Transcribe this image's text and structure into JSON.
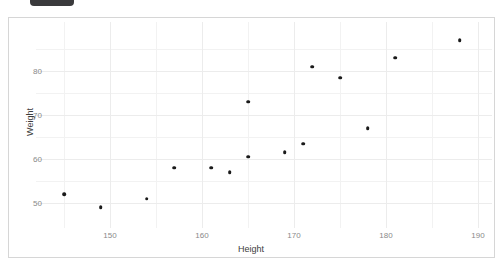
{
  "chrome": {
    "top_badge_label": ""
  },
  "chart_data": {
    "type": "scatter",
    "title": "",
    "subtitle": "",
    "xlabel": "Height",
    "ylabel": "Weight",
    "xlim": [
      143,
      190
    ],
    "ylim": [
      47.5,
      89
    ],
    "grid": true,
    "legend": null,
    "x_ticks": [
      150,
      160,
      170,
      180,
      190
    ],
    "x_tick_labels": [
      "150",
      "160",
      "170",
      "180",
      "190"
    ],
    "y_ticks": [
      50,
      60,
      70,
      80
    ],
    "y_tick_labels": [
      "50",
      "60",
      "70",
      "80"
    ],
    "x_minor_ticks": [
      145,
      155,
      165,
      175,
      185
    ],
    "y_minor_ticks": [
      55,
      65,
      75,
      85
    ],
    "marker_color": "#1a1a1a",
    "grid_color": "#f2f2f2",
    "axis_label_color": "#8a8a8a",
    "series": [
      {
        "name": "observations",
        "x": [
          145,
          149,
          154,
          157,
          161,
          163,
          165,
          165,
          169,
          171,
          172,
          175,
          178,
          181,
          188
        ],
        "y": [
          52.0,
          49.0,
          51.0,
          58.0,
          58.0,
          57.0,
          60.5,
          73.0,
          61.5,
          63.5,
          81.0,
          78.5,
          67.0,
          83.0,
          87.0
        ]
      }
    ],
    "points": [
      {
        "x": 145,
        "y": 52.0
      },
      {
        "x": 149,
        "y": 49.0
      },
      {
        "x": 154,
        "y": 51.0
      },
      {
        "x": 157,
        "y": 58.0
      },
      {
        "x": 161,
        "y": 58.0
      },
      {
        "x": 163,
        "y": 57.0
      },
      {
        "x": 165,
        "y": 60.5
      },
      {
        "x": 165,
        "y": 73.0
      },
      {
        "x": 169,
        "y": 61.5
      },
      {
        "x": 171,
        "y": 63.5
      },
      {
        "x": 172,
        "y": 81.0
      },
      {
        "x": 175,
        "y": 78.5
      },
      {
        "x": 178,
        "y": 67.0
      },
      {
        "x": 181,
        "y": 83.0
      },
      {
        "x": 188,
        "y": 87.0
      }
    ]
  }
}
